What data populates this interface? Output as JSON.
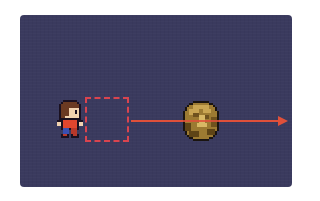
{
  "scene": {
    "background_color": "#3a3a5e",
    "page_background": "#ffffff",
    "character": {
      "sprite": "pixel-hero-facing-right",
      "hair_color": "#6b3a22",
      "skin_color": "#f2d3b0",
      "shirt_color": "#e0462e",
      "pants_color": "#3a4fb0",
      "outline_color": "#1a1020"
    },
    "target_box": {
      "style": "dashed",
      "color": "#d9444f"
    },
    "trajectory_arrow": {
      "color": "#e0503a",
      "direction": "right"
    },
    "rock": {
      "sprite": "pixel-boulder",
      "base_color": "#9c7a32",
      "highlight_color": "#c9a552",
      "shadow_color": "#5e4416",
      "outline_color": "#1a1410"
    }
  }
}
